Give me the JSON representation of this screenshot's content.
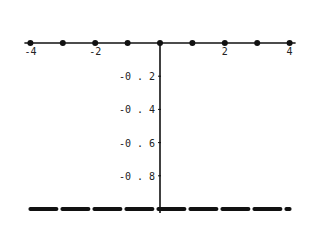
{
  "chart_data": {
    "type": "scatter",
    "title": "",
    "xlabel": "",
    "ylabel": "",
    "xlim": [
      -4,
      4
    ],
    "ylim": [
      -1,
      0
    ],
    "grid": false,
    "legend": null,
    "x_ticks": [
      {
        "value": -4,
        "label": "-4"
      },
      {
        "value": -2,
        "label": "-2"
      },
      {
        "value": 2,
        "label": "2"
      },
      {
        "value": 4,
        "label": "4"
      }
    ],
    "y_ticks": [
      {
        "value": -0.2,
        "label": "-0.2"
      },
      {
        "value": -0.4,
        "label": "-0.4"
      },
      {
        "value": -0.6,
        "label": "-0.6"
      },
      {
        "value": -0.8,
        "label": "-0.8"
      }
    ],
    "series": [
      {
        "name": "points",
        "style": "dots",
        "x": [
          -4,
          -3,
          -2,
          -1,
          0,
          1,
          2,
          3,
          4
        ],
        "y": [
          0,
          0,
          0,
          0,
          0,
          0,
          0,
          0,
          0
        ]
      },
      {
        "name": "dashed line",
        "style": "dashed",
        "x": [
          -4,
          4
        ],
        "y": [
          -1,
          -1
        ]
      }
    ]
  },
  "colors": {
    "ink": "#111111",
    "background": "#ffffff"
  }
}
